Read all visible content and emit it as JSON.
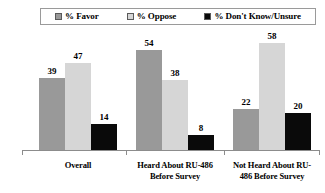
{
  "chart_data": {
    "type": "bar",
    "title": "",
    "subtitle": "",
    "xlabel": "",
    "ylabel": "",
    "ylim": [
      0,
      65
    ],
    "grid": false,
    "legend_position": "top",
    "categories": [
      "Overall",
      "Heard About RU-486 Before Survey",
      "Not Heard About RU-486 Before Survey"
    ],
    "series": [
      {
        "name": "% Favor",
        "color": "#999999",
        "values": [
          39,
          54,
          22
        ]
      },
      {
        "name": "% Oppose",
        "color": "#d6d6d6",
        "values": [
          47,
          38,
          58
        ]
      },
      {
        "name": "% Don't Know/Unsure",
        "color": "#0a0a0a",
        "values": [
          14,
          8,
          20
        ]
      }
    ]
  },
  "legend": {
    "entries": [
      {
        "label": "% Favor",
        "swatch": "#999999"
      },
      {
        "label": "% Oppose",
        "swatch": "#d6d6d6"
      },
      {
        "label": "% Don't Know/Unsure",
        "swatch": "#0a0a0a"
      }
    ]
  },
  "axis": {
    "categories": [
      {
        "line1": "Overall",
        "line2": ""
      },
      {
        "line1": "Heard About RU-486",
        "line2": "Before Survey"
      },
      {
        "line1": "Not Heard About RU-",
        "line2": "486 Before Survey"
      }
    ]
  },
  "values": {
    "g0": {
      "v0": "39",
      "v1": "47",
      "v2": "14"
    },
    "g1": {
      "v0": "54",
      "v1": "38",
      "v2": "8"
    },
    "g2": {
      "v0": "22",
      "v1": "58",
      "v2": "20"
    }
  }
}
